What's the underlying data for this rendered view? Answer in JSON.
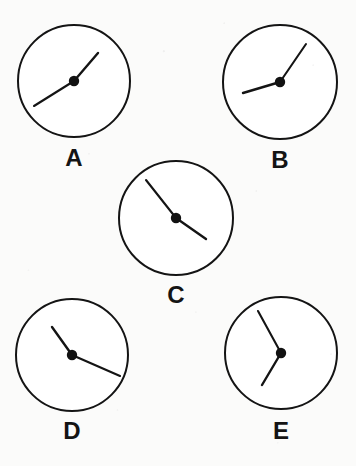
{
  "figure": {
    "background_color": "#fbfbfa",
    "ink_color": "#141414",
    "width": 356,
    "height": 466,
    "label_font_size": 24
  },
  "clocks": [
    {
      "id": "clock-a",
      "label": "A",
      "center": {
        "x": 74,
        "y": 81
      },
      "radius": 56,
      "label_pos": {
        "x": 74,
        "y": 166
      },
      "hub_radius": 5.2,
      "hands": [
        {
          "name": "hand-a-short",
          "kind": "short",
          "angle_deg": 45,
          "length": 37,
          "tip": {
            "x": 98,
            "y": 53
          }
        },
        {
          "name": "hand-a-long",
          "kind": "long",
          "angle_deg": 215,
          "length": 48,
          "tip": {
            "x": 34,
            "y": 106
          }
        }
      ]
    },
    {
      "id": "clock-b",
      "label": "B",
      "center": {
        "x": 280,
        "y": 82
      },
      "radius": 57,
      "label_pos": {
        "x": 280,
        "y": 168
      },
      "hub_radius": 5.2,
      "hands": [
        {
          "name": "hand-b-long",
          "kind": "long",
          "angle_deg": 34,
          "length": 46,
          "tip": {
            "x": 306,
            "y": 44
          }
        },
        {
          "name": "hand-b-short",
          "kind": "short",
          "angle_deg": 190,
          "length": 38,
          "tip": {
            "x": 243,
            "y": 93
          }
        }
      ]
    },
    {
      "id": "clock-c",
      "label": "C",
      "center": {
        "x": 176,
        "y": 218
      },
      "radius": 57,
      "label_pos": {
        "x": 176,
        "y": 303
      },
      "hub_radius": 5.2,
      "hands": [
        {
          "name": "hand-c-long",
          "kind": "long",
          "angle_deg": 129,
          "length": 48,
          "tip": {
            "x": 146,
            "y": 180
          }
        },
        {
          "name": "hand-c-short",
          "kind": "short",
          "angle_deg": 325,
          "length": 36,
          "tip": {
            "x": 206,
            "y": 239
          }
        }
      ]
    },
    {
      "id": "clock-d",
      "label": "D",
      "center": {
        "x": 72,
        "y": 355
      },
      "radius": 56,
      "label_pos": {
        "x": 72,
        "y": 439
      },
      "hub_radius": 5.2,
      "hands": [
        {
          "name": "hand-d-short",
          "kind": "short",
          "angle_deg": 124,
          "length": 35,
          "tip": {
            "x": 52,
            "y": 327
          }
        },
        {
          "name": "hand-d-long",
          "kind": "long",
          "angle_deg": 343,
          "length": 50,
          "tip": {
            "x": 120,
            "y": 376
          }
        }
      ]
    },
    {
      "id": "clock-e",
      "label": "E",
      "center": {
        "x": 281,
        "y": 353
      },
      "radius": 56,
      "label_pos": {
        "x": 281,
        "y": 439
      },
      "hub_radius": 5.2,
      "hands": [
        {
          "name": "hand-e-long",
          "kind": "long",
          "angle_deg": 118,
          "length": 48,
          "tip": {
            "x": 258,
            "y": 311
          }
        },
        {
          "name": "hand-e-short",
          "kind": "short",
          "angle_deg": 239,
          "length": 37,
          "tip": {
            "x": 262,
            "y": 385
          }
        }
      ]
    }
  ]
}
